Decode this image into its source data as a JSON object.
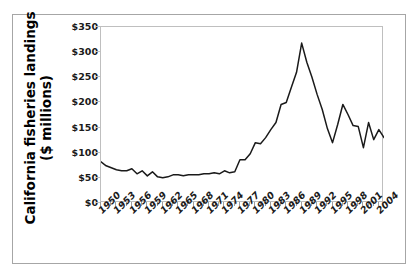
{
  "chart_data": {
    "type": "line",
    "title": "",
    "subtitle": "",
    "xlabel": "",
    "ylabel": "California fisheries landings ($ millions)",
    "ylabel_line1": "California fisheries landings",
    "ylabel_line2": "($ millions)",
    "ylim": [
      0,
      350
    ],
    "xlim": [
      1950,
      2005
    ],
    "ytick_values": [
      0,
      50,
      100,
      150,
      200,
      250,
      300,
      350
    ],
    "ytick_labels": [
      "$0",
      "$50",
      "$100",
      "$150",
      "$200",
      "$250",
      "$300",
      "$350"
    ],
    "xtick_labels": [
      "1950",
      "1953",
      "1956",
      "1959",
      "1962",
      "1965",
      "1968",
      "1971",
      "1974",
      "1977",
      "1980",
      "1983",
      "1986",
      "1989",
      "1992",
      "1995",
      "1998",
      "2001",
      "2004"
    ],
    "xtick_values": [
      1950,
      1953,
      1956,
      1959,
      1962,
      1965,
      1968,
      1971,
      1974,
      1977,
      1980,
      1983,
      1986,
      1989,
      1992,
      1995,
      1998,
      2001,
      2004
    ],
    "grid": false,
    "legend": null,
    "line_color": "#1a1a1a",
    "series": [
      {
        "name": "California fisheries landings",
        "x": [
          1950,
          1951,
          1952,
          1953,
          1954,
          1955,
          1956,
          1957,
          1958,
          1959,
          1960,
          1961,
          1962,
          1963,
          1964,
          1965,
          1966,
          1967,
          1968,
          1969,
          1970,
          1971,
          1972,
          1973,
          1974,
          1975,
          1976,
          1977,
          1978,
          1979,
          1980,
          1981,
          1982,
          1983,
          1984,
          1985,
          1986,
          1987,
          1988,
          1989,
          1990,
          1991,
          1992,
          1993,
          1994,
          1995,
          1996,
          1997,
          1998,
          1999,
          2000,
          2001,
          2002,
          2003,
          2004,
          2005
        ],
        "y": [
          82,
          74,
          70,
          66,
          64,
          64,
          68,
          58,
          64,
          54,
          62,
          52,
          50,
          52,
          56,
          56,
          54,
          56,
          56,
          56,
          58,
          58,
          60,
          58,
          64,
          60,
          62,
          86,
          86,
          98,
          120,
          118,
          130,
          146,
          160,
          196,
          200,
          230,
          260,
          318,
          280,
          250,
          216,
          186,
          148,
          120,
          156,
          196,
          176,
          154,
          152,
          110,
          160,
          126,
          146,
          130
        ]
      }
    ]
  }
}
